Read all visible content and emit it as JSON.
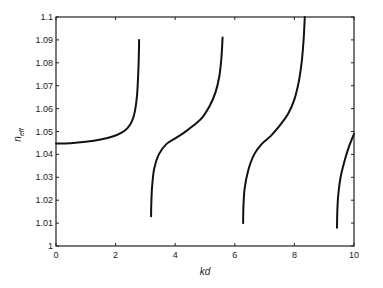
{
  "chart_data": {
    "type": "line",
    "title": "",
    "xlabel": "kd",
    "ylabel": "n_eff",
    "ylabel_main": "n",
    "ylabel_sub": "eff",
    "xlim": [
      0,
      10
    ],
    "ylim": [
      1.0,
      1.1
    ],
    "xticks": [
      0,
      2,
      4,
      6,
      8,
      10
    ],
    "xtick_labels": [
      "0",
      "2",
      "4",
      "6",
      "8",
      "10"
    ],
    "yticks": [
      1.0,
      1.01,
      1.02,
      1.03,
      1.04,
      1.05,
      1.06,
      1.07,
      1.08,
      1.09,
      1.1
    ],
    "ytick_labels": [
      "1",
      "1.01",
      "1.02",
      "1.03",
      "1.04",
      "1.05",
      "1.06",
      "1.07",
      "1.08",
      "1.09",
      "1.1"
    ],
    "grid": false,
    "legend": null,
    "line_color": "#111111",
    "series": [
      {
        "name": "branch-1",
        "points": [
          [
            0,
            1.0448
          ],
          [
            0.5,
            1.0449
          ],
          [
            1.0,
            1.0455
          ],
          [
            1.5,
            1.0465
          ],
          [
            1.9,
            1.0478
          ],
          [
            2.2,
            1.0495
          ],
          [
            2.4,
            1.0515
          ],
          [
            2.55,
            1.0545
          ],
          [
            2.65,
            1.059
          ],
          [
            2.72,
            1.066
          ],
          [
            2.76,
            1.075
          ],
          [
            2.78,
            1.083
          ],
          [
            2.79,
            1.09
          ]
        ]
      },
      {
        "name": "branch-2",
        "points": [
          [
            3.19,
            1.013
          ],
          [
            3.2,
            1.02
          ],
          [
            3.23,
            1.027
          ],
          [
            3.3,
            1.034
          ],
          [
            3.45,
            1.04
          ],
          [
            3.7,
            1.0445
          ],
          [
            4.0,
            1.047
          ],
          [
            4.3,
            1.0495
          ],
          [
            4.6,
            1.0525
          ],
          [
            4.9,
            1.056
          ],
          [
            5.15,
            1.061
          ],
          [
            5.35,
            1.067
          ],
          [
            5.48,
            1.074
          ],
          [
            5.55,
            1.082
          ],
          [
            5.59,
            1.091
          ]
        ]
      },
      {
        "name": "branch-3",
        "points": [
          [
            6.28,
            1.01
          ],
          [
            6.29,
            1.017
          ],
          [
            6.33,
            1.025
          ],
          [
            6.45,
            1.033
          ],
          [
            6.65,
            1.04
          ],
          [
            6.9,
            1.0445
          ],
          [
            7.2,
            1.048
          ],
          [
            7.5,
            1.0525
          ],
          [
            7.8,
            1.058
          ],
          [
            8.0,
            1.064
          ],
          [
            8.15,
            1.072
          ],
          [
            8.25,
            1.081
          ],
          [
            8.31,
            1.09
          ],
          [
            8.35,
            1.1
          ]
        ]
      },
      {
        "name": "branch-4",
        "points": [
          [
            9.43,
            1.008
          ],
          [
            9.44,
            1.015
          ],
          [
            9.47,
            1.022
          ],
          [
            9.55,
            1.03
          ],
          [
            9.7,
            1.038
          ],
          [
            9.85,
            1.044
          ],
          [
            10.0,
            1.049
          ]
        ]
      }
    ]
  }
}
